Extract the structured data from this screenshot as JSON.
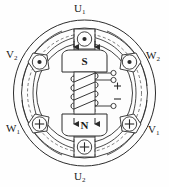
{
  "figure": {
    "labels": {
      "u1": {
        "base": "U",
        "sub": "1"
      },
      "u2": {
        "base": "U",
        "sub": "2"
      },
      "v1": {
        "base": "V",
        "sub": "1"
      },
      "v2": {
        "base": "V",
        "sub": "2"
      },
      "w1": {
        "base": "W",
        "sub": "1"
      },
      "w2": {
        "base": "W",
        "sub": "2"
      }
    },
    "rotor": {
      "north_pole_label": "N",
      "south_pole_label": "S"
    },
    "terminals": {
      "positive": "+",
      "negative": "−"
    },
    "slots": [
      {
        "name": "slot-u1-top",
        "symbol": "dot",
        "position": "top"
      },
      {
        "name": "slot-v2-upper-left",
        "symbol": "dot",
        "position": "upper-left"
      },
      {
        "name": "slot-w2-upper-right",
        "symbol": "dot",
        "position": "upper-right"
      },
      {
        "name": "slot-w1-lower-left",
        "symbol": "cross",
        "position": "lower-left"
      },
      {
        "name": "slot-v1-lower-right",
        "symbol": "cross",
        "position": "lower-right"
      },
      {
        "name": "slot-u2-bottom",
        "symbol": "cross",
        "position": "bottom"
      }
    ],
    "colors": {
      "line": "#2b2b2b",
      "fill": "#fdfdfd",
      "background": "#fefefe",
      "text": "#1a1a1a"
    }
  }
}
